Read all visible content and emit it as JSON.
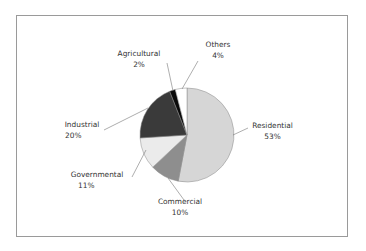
{
  "chart_data": {
    "type": "pie",
    "title": "",
    "categories": [
      "Residential",
      "Commercial",
      "Governmental",
      "Industrial",
      "Agricultural",
      "Others"
    ],
    "values": [
      53,
      10,
      11,
      20,
      2,
      4
    ],
    "unit": "%",
    "start_angle": "12 o'clock, clockwise",
    "colors": [
      "#d6d6d6",
      "#8e8e8e",
      "#ebebeb",
      "#3a3a3a",
      "#0a0a0a",
      "#ffffff"
    ],
    "labels": [
      {
        "name": "Residential",
        "pct": "53%"
      },
      {
        "name": "Commercial",
        "pct": "10%"
      },
      {
        "name": "Governmental",
        "pct": "11%"
      },
      {
        "name": "Industrial",
        "pct": "20%"
      },
      {
        "name": "Agricultural",
        "pct": "2%"
      },
      {
        "name": "Others",
        "pct": "4%"
      }
    ],
    "legend": "none (leader-line labels)",
    "grid": false
  }
}
